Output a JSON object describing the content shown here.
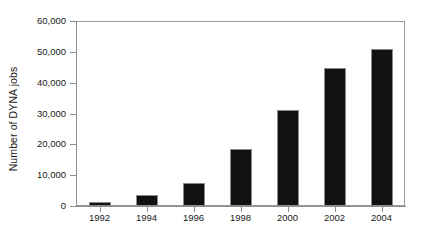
{
  "chart_data": {
    "type": "bar",
    "title": "",
    "subtitle": "",
    "xlabel": "",
    "ylabel": "Number of DYNA jobs",
    "categories": [
      "1992",
      "1994",
      "1996",
      "1998",
      "2000",
      "2002",
      "2004"
    ],
    "values": [
      1300,
      3600,
      7500,
      18500,
      31200,
      44700,
      50800
    ],
    "series": [
      {
        "name": "Number of DYNA jobs",
        "values": [
          1300,
          3600,
          7500,
          18500,
          31200,
          44700,
          50800
        ]
      }
    ],
    "ylim": [
      0,
      60000
    ],
    "ytick_values": [
      0,
      10000,
      20000,
      30000,
      40000,
      50000,
      60000
    ],
    "ytick_labels": [
      "0",
      "10,000",
      "20,000",
      "30,000",
      "40,000",
      "50,000",
      "60,000"
    ],
    "xtick_labels": [
      "1992",
      "1994",
      "1996",
      "1998",
      "2000",
      "2002",
      "2004"
    ],
    "grid": false,
    "legend": false,
    "legend_position": "none",
    "bar_color": "#111111",
    "bar_edge_color": "#8a8a8a",
    "axis_color": "#8d8d8d",
    "background_color": "#ffffff",
    "annotations": []
  }
}
